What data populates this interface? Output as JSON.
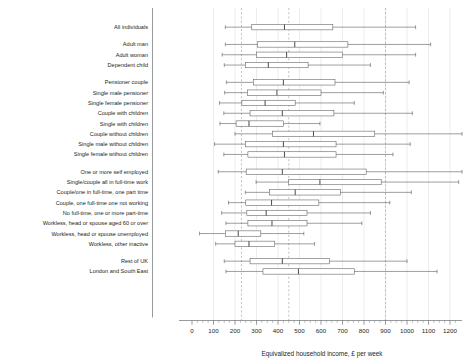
{
  "chart_data": {
    "type": "boxplot",
    "title": "",
    "xlabel": "Equivalized household income, £ per week",
    "ylabel": "",
    "xlim": [
      0,
      1240
    ],
    "xticks": [
      0,
      100,
      200,
      300,
      400,
      500,
      600,
      700,
      800,
      900,
      1000,
      1100,
      1200
    ],
    "xtick_labels": [
      "0",
      "100",
      "200",
      "300",
      "400",
      "500",
      "600",
      "700",
      "800",
      "900",
      "1000",
      "1100",
      "1200"
    ],
    "minor_tick_step": 25,
    "grid": true,
    "grid_axis": "x",
    "legend": "none",
    "reference_lines": [
      230,
      450,
      900
    ],
    "box_color": "#ffffff",
    "line_color": "#58595b",
    "categories": [
      "All individuals",
      "Adult man",
      "Adult woman",
      "Dependent child",
      "Pensioner couple",
      "Single male pensioner",
      "Single female pensioner",
      "Couple with children",
      "Single with children",
      "Couple without children",
      "Single male without children",
      "Single female without children",
      "One or more self employed",
      "Single/couple all in full-time work",
      "Couple/one in full-time, one part time",
      "Couple, one full-time one not working",
      "No full-time, one or more part-time",
      "Workless, head or spouse aged 60 or over",
      "Workless, head or spouse unemployed",
      "Workless, other inactive",
      "Rest of UK",
      "London and South East"
    ],
    "boxes": [
      {
        "category": "All individuals",
        "low": 155,
        "q1": 278,
        "median": 430,
        "q3": 655,
        "high": 1040,
        "group": 0
      },
      {
        "category": "Adult man",
        "low": 155,
        "q1": 305,
        "median": 478,
        "q3": 725,
        "high": 1110,
        "group": 1
      },
      {
        "category": "Adult woman",
        "low": 140,
        "q1": 300,
        "median": 440,
        "q3": 700,
        "high": 1040,
        "group": 1
      },
      {
        "category": "Dependent child",
        "low": 150,
        "q1": 248,
        "median": 355,
        "q3": 540,
        "high": 830,
        "group": 1
      },
      {
        "category": "Pensioner couple",
        "low": 160,
        "q1": 285,
        "median": 425,
        "q3": 665,
        "high": 1010,
        "group": 2
      },
      {
        "category": "Single male pensioner",
        "low": 152,
        "q1": 258,
        "median": 395,
        "q3": 600,
        "high": 890,
        "group": 2
      },
      {
        "category": "Single female pensioner",
        "low": 128,
        "q1": 232,
        "median": 340,
        "q3": 480,
        "high": 755,
        "group": 2
      },
      {
        "category": "Couple with children",
        "low": 148,
        "q1": 270,
        "median": 420,
        "q3": 660,
        "high": 1025,
        "group": 2
      },
      {
        "category": "Single with children",
        "low": 130,
        "q1": 205,
        "median": 265,
        "q3": 425,
        "high": 595,
        "group": 2
      },
      {
        "category": "Couple without children",
        "low": 200,
        "q1": 375,
        "median": 565,
        "q3": 850,
        "high": 1270,
        "group": 2
      },
      {
        "category": "Single male without children",
        "low": 105,
        "q1": 248,
        "median": 425,
        "q3": 670,
        "high": 1015,
        "group": 2
      },
      {
        "category": "Single female without children",
        "low": 148,
        "q1": 260,
        "median": 430,
        "q3": 670,
        "high": 935,
        "group": 2
      },
      {
        "category": "One or more self employed",
        "low": 122,
        "q1": 252,
        "median": 420,
        "q3": 810,
        "high": 1440,
        "group": 3
      },
      {
        "category": "Single/couple all in full-time work",
        "low": 298,
        "q1": 450,
        "median": 595,
        "q3": 880,
        "high": 1240,
        "group": 3
      },
      {
        "category": "Couple/one in full-time, one part time",
        "low": 248,
        "q1": 360,
        "median": 480,
        "q3": 690,
        "high": 1020,
        "group": 3
      },
      {
        "category": "Couple, one full-time one not working",
        "low": 170,
        "q1": 250,
        "median": 370,
        "q3": 590,
        "high": 920,
        "group": 3
      },
      {
        "category": "No full-time, one or more part-time",
        "low": 138,
        "q1": 255,
        "median": 345,
        "q3": 535,
        "high": 830,
        "group": 3
      },
      {
        "category": "Workless, head or spouse aged 60 or over",
        "low": 158,
        "q1": 260,
        "median": 372,
        "q3": 535,
        "high": 790,
        "group": 3
      },
      {
        "category": "Workless, head or spouse unemployed",
        "low": 35,
        "q1": 155,
        "median": 215,
        "q3": 320,
        "high": 520,
        "group": 3
      },
      {
        "category": "Workless, other inactive",
        "low": 110,
        "q1": 200,
        "median": 265,
        "q3": 385,
        "high": 570,
        "group": 3
      },
      {
        "category": "Rest of UK",
        "low": 150,
        "q1": 270,
        "median": 420,
        "q3": 640,
        "high": 1000,
        "group": 4
      },
      {
        "category": "London and South East",
        "low": 158,
        "q1": 330,
        "median": 495,
        "q3": 755,
        "high": 1140,
        "group": 4
      }
    ]
  }
}
